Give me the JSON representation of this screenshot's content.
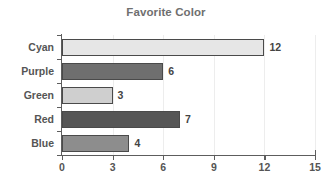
{
  "chart_data": {
    "type": "bar",
    "orientation": "horizontal",
    "title": "Favorite Color",
    "xlabel": "",
    "ylabel": "",
    "categories": [
      "Cyan",
      "Purple",
      "Green",
      "Red",
      "Blue"
    ],
    "values": [
      12,
      6,
      3,
      7,
      4
    ],
    "value_labels": [
      "12",
      "6",
      "3",
      "7",
      "4"
    ],
    "bar_colors": [
      "#e6e6e6",
      "#6f6f6f",
      "#cfcfcf",
      "#565656",
      "#8d8d8d"
    ],
    "bar_edge_color": "#4a4a4a",
    "xlim": [
      0,
      15
    ],
    "xticks": [
      0,
      3,
      6,
      9,
      12,
      15
    ],
    "xtick_labels": [
      "0",
      "3",
      "6",
      "9",
      "12",
      "15"
    ],
    "grid": true,
    "grid_axis": "x",
    "grid_color": "#ededed",
    "legend": false,
    "axis_color": "#5d5d5d",
    "title_color": "#6f6f6f",
    "label_color": "#555555",
    "background": "#ffffff"
  }
}
